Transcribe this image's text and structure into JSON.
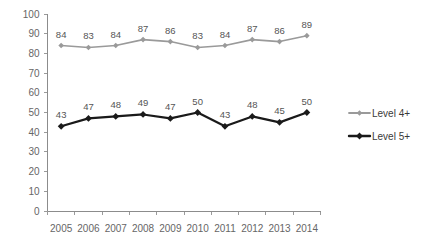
{
  "top_cutoff_text": "",
  "chart_data": {
    "type": "line",
    "title": "",
    "subtitle": "",
    "xlabel": "",
    "ylabel": "",
    "categories": [
      "2005",
      "2006",
      "2007",
      "2008",
      "2009",
      "2010",
      "2011",
      "2012",
      "2013",
      "2014"
    ],
    "series": [
      {
        "name": "Level 4+",
        "color": "#9a9a9a",
        "marker": "diamond",
        "values": [
          84,
          83,
          84,
          87,
          86,
          83,
          84,
          87,
          86,
          89
        ],
        "show_data_labels": true
      },
      {
        "name": "Level 5+",
        "color": "#1a1a1a",
        "marker": "diamond",
        "values": [
          43,
          47,
          48,
          49,
          47,
          50,
          43,
          48,
          45,
          50
        ],
        "show_data_labels": true
      }
    ],
    "ylim": [
      0,
      100
    ],
    "ytick_step": 10,
    "yticks": [
      "100",
      "90",
      "80",
      "70",
      "60",
      "50",
      "40",
      "30",
      "20",
      "10",
      "0"
    ],
    "grid": false,
    "legend_position": "right",
    "legend": [
      "Level 4+",
      "Level 5+"
    ]
  },
  "axes": {
    "y_axis_name": "value-axis",
    "x_axis_name": "year-axis"
  }
}
